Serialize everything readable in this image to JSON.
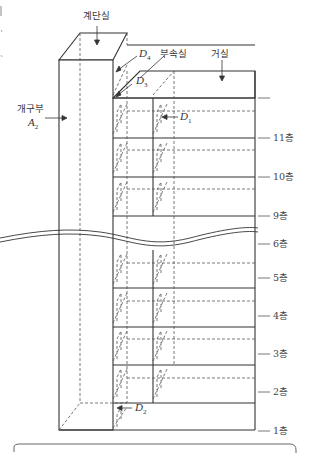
{
  "diagram": {
    "title": "",
    "labels": {
      "stair_room": "계단실",
      "annex_room": "부속실",
      "living_room": "거실",
      "opening": "개구부",
      "opening_symbol": "A",
      "opening_subscript": "2"
    },
    "doors": [
      {
        "symbol": "D",
        "subscript": "1"
      },
      {
        "symbol": "D",
        "subscript": "2"
      },
      {
        "symbol": "D",
        "subscript": "3"
      },
      {
        "symbol": "D",
        "subscript": "4"
      }
    ],
    "floors": [
      "11층",
      "10층",
      "9층",
      "6층",
      "5층",
      "4층",
      "3층",
      "2층",
      "1층"
    ],
    "colors": {
      "line": "#333333",
      "dashed": "#555555",
      "background": "#ffffff"
    }
  }
}
